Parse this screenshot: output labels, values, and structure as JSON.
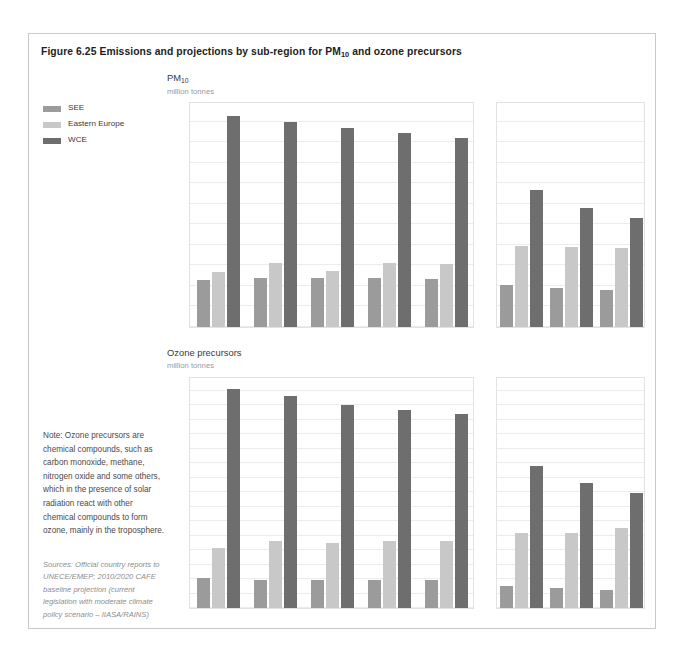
{
  "figure": {
    "title_prefix": "Figure 6.25 Emissions and projections by sub-region for PM",
    "title_sub": "10",
    "title_suffix": " and ozone precursors"
  },
  "legend": {
    "items": [
      {
        "label": "SEE",
        "color": "#9b9b9b"
      },
      {
        "label": "Eastern Europe",
        "color": "#c8c8c8"
      },
      {
        "label": "WCE",
        "color": "#6e6e6e"
      }
    ]
  },
  "note": {
    "text": "Note: Ozone precursors are chemical compounds, such as carbon monoxide, methane, nitrogen oxide and some others, which in the presence of solar radiation react with other chemical compounds to form ozone, mainly in the troposphere."
  },
  "sources": {
    "text": "Sources: Official country reports to UNECE/EMEP; 2010/2020 CAFE baseline projection (current legislation with moderate climate policy scenario – IIASA/RAINS)"
  },
  "chart_data": [
    {
      "id": "pm10",
      "type": "bar",
      "title": "PM",
      "title_sub": "10",
      "ylabel": "million tonnes",
      "xlabel": "",
      "ylim": [
        0,
        22
      ],
      "ytick_step": 2,
      "yticks": [
        0,
        2,
        4,
        6,
        8,
        10,
        12,
        14,
        16,
        18,
        20,
        22
      ],
      "grid": true,
      "legend_position": "left",
      "panels": [
        {
          "name": "historical",
          "categories": [
            "2000",
            "2001",
            "2002",
            "2003",
            "2004"
          ],
          "series": [
            {
              "name": "SEE",
              "color": "#9b9b9b",
              "values": [
                4.6,
                4.8,
                4.8,
                4.8,
                4.7
              ]
            },
            {
              "name": "Eastern Europe",
              "color": "#c8c8c8",
              "values": [
                5.4,
                6.2,
                5.5,
                6.2,
                6.1
              ]
            },
            {
              "name": "WCE",
              "color": "#6e6e6e",
              "values": [
                20.5,
                20.0,
                19.4,
                18.9,
                18.4
              ]
            }
          ]
        },
        {
          "name": "projection",
          "categories": [
            "2010",
            "2015",
            "2020"
          ],
          "series": [
            {
              "name": "SEE",
              "color": "#9b9b9b",
              "values": [
                4.1,
                3.8,
                3.6
              ]
            },
            {
              "name": "Eastern Europe",
              "color": "#c8c8c8",
              "values": [
                7.9,
                7.8,
                7.7
              ]
            },
            {
              "name": "WCE",
              "color": "#6e6e6e",
              "values": [
                13.3,
                11.6,
                10.6
              ]
            }
          ]
        }
      ]
    },
    {
      "id": "ozone-precursors",
      "type": "bar",
      "title": "Ozone precursors",
      "title_sub": "",
      "ylabel": "million tonnes",
      "xlabel": "",
      "ylim": [
        0,
        32
      ],
      "ytick_step": 2,
      "yticks": [
        0,
        2,
        4,
        6,
        8,
        10,
        12,
        14,
        16,
        18,
        20,
        22,
        24,
        26,
        28,
        30,
        32
      ],
      "grid": true,
      "legend_position": "left",
      "panels": [
        {
          "name": "historical",
          "categories": [
            "2000",
            "2001",
            "2002",
            "2003",
            "2004"
          ],
          "series": [
            {
              "name": "SEE",
              "color": "#9b9b9b",
              "values": [
                4.1,
                3.9,
                3.9,
                3.9,
                3.9
              ]
            },
            {
              "name": "Eastern Europe",
              "color": "#c8c8c8",
              "values": [
                8.3,
                9.3,
                9.0,
                9.2,
                9.3
              ]
            },
            {
              "name": "WCE",
              "color": "#6e6e6e",
              "values": [
                30.2,
                29.2,
                28.0,
                27.3,
                26.8
              ]
            }
          ]
        },
        {
          "name": "projection",
          "categories": [
            "2010",
            "2015",
            "2020"
          ],
          "series": [
            {
              "name": "SEE",
              "color": "#9b9b9b",
              "values": [
                3.0,
                2.8,
                2.5
              ]
            },
            {
              "name": "Eastern Europe",
              "color": "#c8c8c8",
              "values": [
                10.4,
                10.4,
                11.1
              ]
            },
            {
              "name": "WCE",
              "color": "#6e6e6e",
              "values": [
                19.6,
                17.2,
                15.8
              ]
            }
          ]
        }
      ]
    }
  ]
}
